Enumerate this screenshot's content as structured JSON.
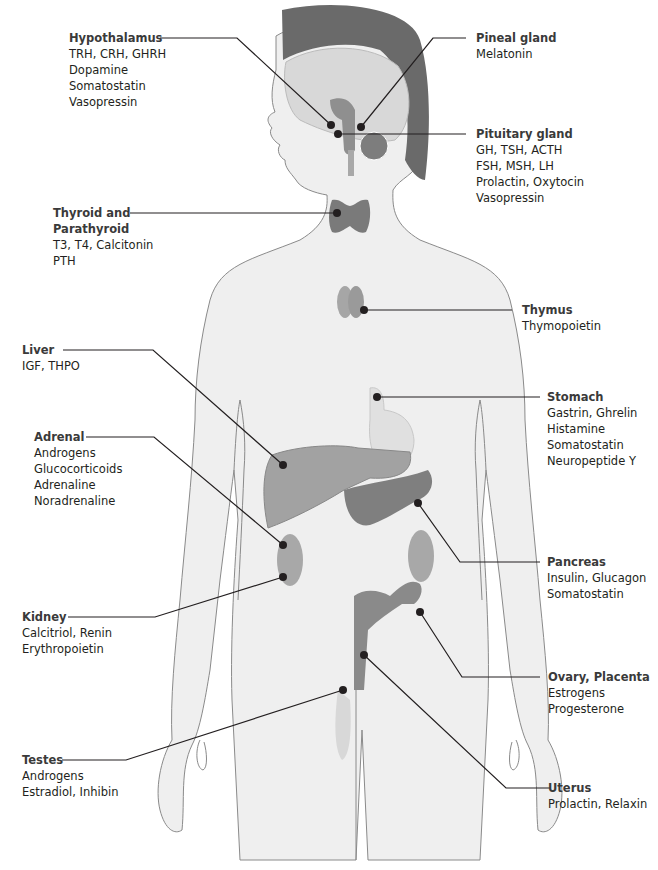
{
  "diagram": {
    "title_cut_off": "Endocrine System",
    "labels": [
      {
        "id": "hypothalamus",
        "title": "Hypothalamus",
        "lines": [
          "TRH, CRH, GHRH",
          "Dopamine",
          "Somatostatin",
          "Vasopressin"
        ]
      },
      {
        "id": "pineal",
        "title": "Pineal gland",
        "lines": [
          "Melatonin"
        ]
      },
      {
        "id": "pituitary",
        "title": "Pituitary gland",
        "lines": [
          "GH, TSH, ACTH",
          "FSH, MSH, LH",
          "Prolactin, Oxytocin",
          "Vasopressin"
        ]
      },
      {
        "id": "thyroid",
        "title": "Thyroid and",
        "title2": "Parathyroid",
        "lines": [
          "T3, T4, Calcitonin",
          "PTH"
        ]
      },
      {
        "id": "thymus",
        "title": "Thymus",
        "lines": [
          "Thymopoietin"
        ]
      },
      {
        "id": "liver",
        "title": "Liver",
        "lines": [
          "IGF, THPO"
        ]
      },
      {
        "id": "stomach",
        "title": "Stomach",
        "lines": [
          "Gastrin, Ghrelin",
          "Histamine",
          "Somatostatin",
          "Neuropeptide Y"
        ]
      },
      {
        "id": "adrenal",
        "title": "Adrenal",
        "lines": [
          "Androgens",
          "Glucocorticoids",
          "Adrenaline",
          "Noradrenaline"
        ]
      },
      {
        "id": "pancreas",
        "title": "Pancreas",
        "lines": [
          "Insulin, Glucagon",
          "Somatostatin"
        ]
      },
      {
        "id": "kidney",
        "title": "Kidney",
        "lines": [
          "Calcitriol, Renin",
          "Erythropoietin"
        ]
      },
      {
        "id": "ovary",
        "title": "Ovary, Placenta",
        "lines": [
          "Estrogens",
          "Progesterone"
        ]
      },
      {
        "id": "testes",
        "title": "Testes",
        "lines": [
          "Androgens",
          "Estradiol, Inhibin"
        ]
      },
      {
        "id": "uterus",
        "title": "Uterus",
        "lines": [
          "Prolactin, Relaxin"
        ]
      }
    ],
    "colors": {
      "body_fill": "#efefef",
      "body_stroke": "#8a8a8a",
      "skull": "#6a6a6a",
      "brain": "#d8d8d8",
      "organ_mid": "#9a9a9a",
      "organ_dark": "#7a7a7a",
      "leader": "#231f20"
    }
  }
}
